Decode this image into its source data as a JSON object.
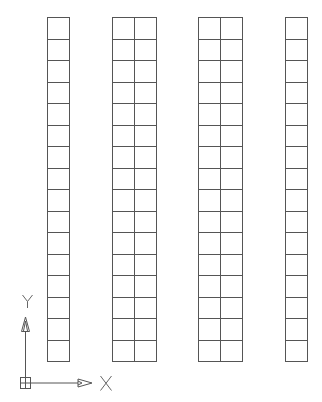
{
  "drawing": {
    "background": "#ffffff",
    "line_color": "#555555",
    "top": 17,
    "bottom": 361,
    "row_count": 16,
    "columns": [
      {
        "name": "column-1",
        "left": 47,
        "right": 69,
        "cells_wide": 1
      },
      {
        "name": "column-2",
        "left": 112,
        "right": 156,
        "cells_wide": 2
      },
      {
        "name": "column-3",
        "left": 198,
        "right": 242,
        "cells_wide": 2
      },
      {
        "name": "column-4",
        "left": 285,
        "right": 307,
        "cells_wide": 1
      }
    ]
  },
  "ucs_icon": {
    "x_label": "X",
    "y_label": "Y",
    "color": "#555555"
  }
}
